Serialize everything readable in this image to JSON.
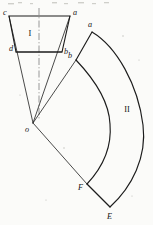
{
  "figure": {
    "background_color": "#fbfbf9",
    "ink_color": "#1c1c1c",
    "shapes": [
      {
        "id": "shape-I",
        "label": "I",
        "label_x": 30,
        "label_y": 33,
        "kind": "trapezoid-sector-blank",
        "outline": "M 9 16 L 70 16 L 62 52 L 16 52 Z",
        "apex": {
          "x": 33,
          "y": 123,
          "label": "o",
          "label_x": 28,
          "label_y": 129
        }
      },
      {
        "id": "shape-II",
        "label": "II",
        "label_x": 127,
        "label_y": 110,
        "kind": "annular-sector",
        "outline": "M 92 32 C 118 48 139 86 143 126 C 146 158 132 186 110 207 L 87 184 C 103 168 112 146 110 124 C 108 99 93 78 76 60 Z"
      }
    ],
    "rays": [
      {
        "id": "ray-o-c",
        "from": "o",
        "to": "c",
        "x1": 33,
        "y1": 123,
        "x2": 9,
        "y2": 16
      },
      {
        "id": "ray-o-a",
        "from": "o",
        "to": "a",
        "x1": 33,
        "y1": 123,
        "x2": 70,
        "y2": 16
      },
      {
        "id": "ray-o-b2",
        "from": "o",
        "to": "b-II",
        "x1": 33,
        "y1": 123,
        "x2": 76,
        "y2": 60
      },
      {
        "id": "ray-o-F",
        "from": "o",
        "to": "F",
        "x1": 33,
        "y1": 123,
        "x2": 87,
        "y2": 184
      }
    ],
    "centerline": {
      "id": "centerline",
      "x1": 39,
      "y1": 8,
      "x2": 39,
      "y2": 120
    },
    "points": [
      {
        "id": "point-c",
        "label": "c",
        "x": 9,
        "y": 16,
        "label_x": 4,
        "label_y": 13
      },
      {
        "id": "point-a-I",
        "label": "a",
        "x": 70,
        "y": 16,
        "label_x": 74,
        "label_y": 13
      },
      {
        "id": "point-d",
        "label": "d",
        "x": 16,
        "y": 52,
        "label_x": 11,
        "label_y": 49
      },
      {
        "id": "point-b-I",
        "label": "b",
        "x": 62,
        "y": 52,
        "label_x": 65,
        "label_y": 51
      },
      {
        "id": "point-o",
        "label": "o",
        "x": 33,
        "y": 123,
        "label_x": 27,
        "label_y": 129
      },
      {
        "id": "point-a-II",
        "label": "a",
        "x": 92,
        "y": 32,
        "label_x": 89,
        "label_y": 25
      },
      {
        "id": "point-b-II",
        "label": "b",
        "x": 76,
        "y": 60,
        "label_x": 70,
        "label_y": 56
      },
      {
        "id": "point-F",
        "label": "F",
        "x": 87,
        "y": 184,
        "label_x": 81,
        "label_y": 188
      },
      {
        "id": "point-E",
        "label": "E",
        "x": 110,
        "y": 207,
        "label_x": 110,
        "label_y": 216
      }
    ],
    "inner_chords": [
      {
        "id": "chord-db",
        "x1": 16,
        "y1": 52,
        "x2": 62,
        "y2": 52
      }
    ]
  }
}
